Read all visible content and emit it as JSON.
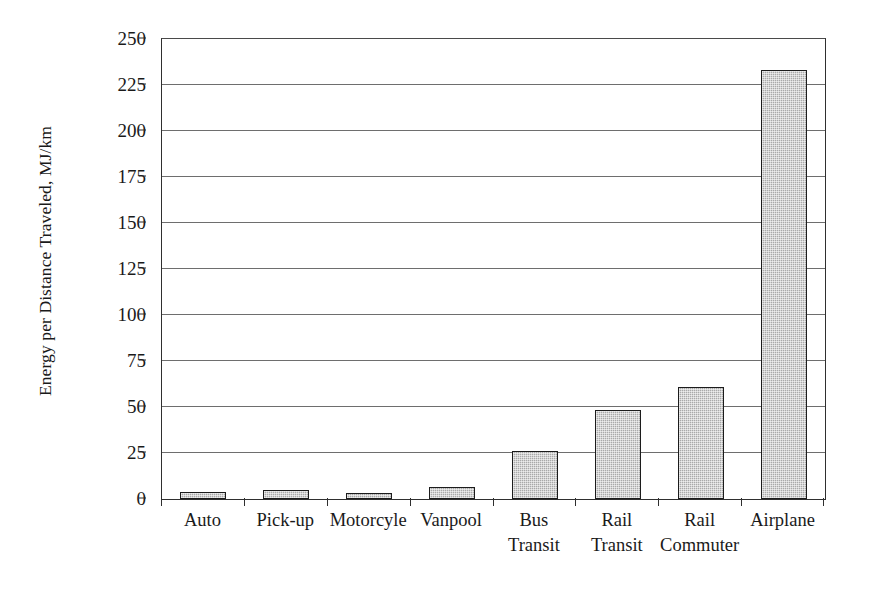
{
  "chart_data": {
    "type": "bar",
    "title": "",
    "xlabel": "",
    "ylabel": "Energy per Distance Traveled, MJ/km",
    "ylim": [
      0,
      250
    ],
    "ytick_step": 25,
    "ytick_labels": [
      "250",
      "225",
      "200",
      "175",
      "150",
      "125",
      "100",
      "75",
      "50",
      "25",
      "0"
    ],
    "ytick_values": [
      250,
      225,
      200,
      175,
      150,
      125,
      100,
      75,
      50,
      25,
      0
    ],
    "grid": true,
    "legend": false,
    "legend_position": "none",
    "categories": [
      "Auto",
      "Pick-up",
      "Motorcyle",
      "Vanpool",
      "Bus Transit",
      "Rail Transit",
      "Rail Commuter",
      "Airplane"
    ],
    "category_lines": [
      [
        "Auto"
      ],
      [
        "Pick-up"
      ],
      [
        "Motorcyle"
      ],
      [
        "Vanpool"
      ],
      [
        "Bus",
        "Transit"
      ],
      [
        "Rail",
        "Transit"
      ],
      [
        "Rail",
        "Commuter"
      ],
      [
        "Airplane"
      ]
    ],
    "values": [
      4,
      5,
      2,
      6.5,
      26,
      48.5,
      61,
      233
    ],
    "series": [
      {
        "name": "Energy per Distance Traveled",
        "values": [
          4,
          5,
          2,
          6.5,
          26,
          48.5,
          61,
          233
        ]
      }
    ],
    "bar_fill_color": "#a9a9a9",
    "bar_border_color": "#1c1c1c",
    "gridline_color": "#6e6e6e",
    "axis_color": "#2f2f2f",
    "background_color": "#ffffff"
  }
}
